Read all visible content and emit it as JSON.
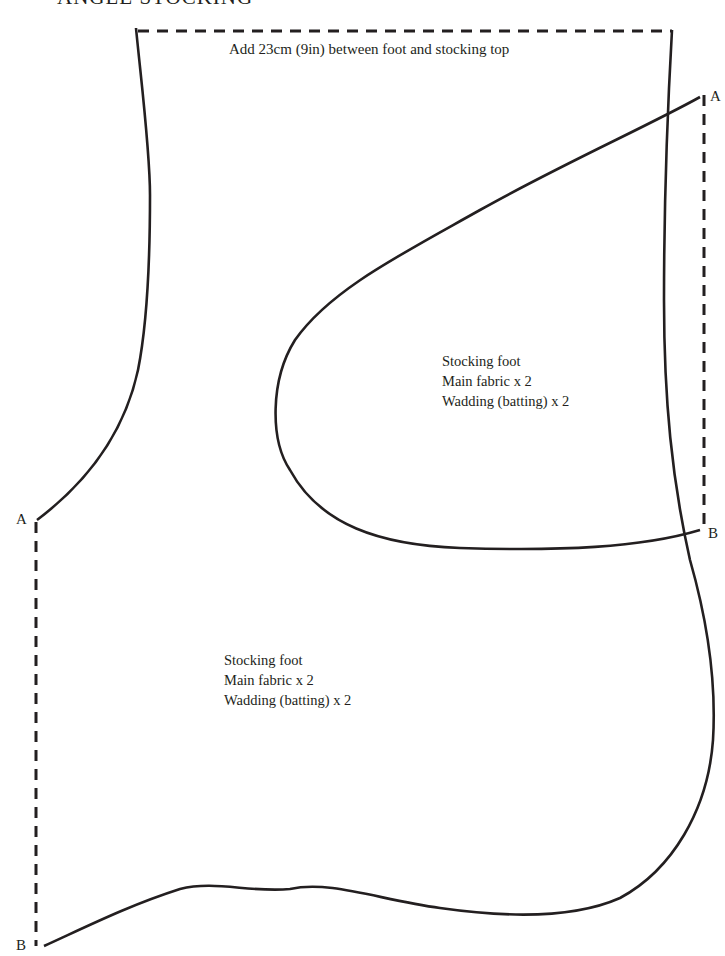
{
  "title": "ANGLE STOCKING",
  "instruction": "Add 23cm (9in) between foot and stocking top",
  "pieces": [
    {
      "name": "upper",
      "lines": [
        "Stocking foot",
        "Main fabric x 2",
        "Wadding (batting) x 2"
      ]
    },
    {
      "name": "lower",
      "lines": [
        "Stocking foot",
        "Main fabric x 2",
        "Wadding (batting) x 2"
      ]
    }
  ],
  "markers": {
    "upper_right_top": "A",
    "upper_right_bottom": "B",
    "left_top": "A",
    "left_bottom": "B"
  },
  "colors": {
    "line": "#231f20",
    "background": "#ffffff"
  }
}
